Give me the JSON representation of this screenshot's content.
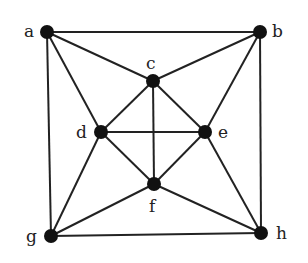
{
  "graph": {
    "nodes": [
      {
        "id": "a",
        "label": "a",
        "x": 47,
        "y": 32,
        "lx": 24,
        "ly": 37
      },
      {
        "id": "b",
        "label": "b",
        "x": 260,
        "y": 32,
        "lx": 272,
        "ly": 37
      },
      {
        "id": "c",
        "label": "c",
        "x": 153,
        "y": 81,
        "lx": 146,
        "ly": 69
      },
      {
        "id": "d",
        "label": "d",
        "x": 101,
        "y": 132,
        "lx": 76,
        "ly": 138
      },
      {
        "id": "e",
        "label": "e",
        "x": 205,
        "y": 132,
        "lx": 218,
        "ly": 138
      },
      {
        "id": "f",
        "label": "f",
        "x": 154,
        "y": 184,
        "lx": 149,
        "ly": 212
      },
      {
        "id": "g",
        "label": "g",
        "x": 51,
        "y": 236,
        "lx": 26,
        "ly": 242
      },
      {
        "id": "h",
        "label": "h",
        "x": 261,
        "y": 233,
        "lx": 276,
        "ly": 239
      }
    ],
    "edges": [
      [
        "a",
        "b"
      ],
      [
        "a",
        "g"
      ],
      [
        "a",
        "c"
      ],
      [
        "a",
        "d"
      ],
      [
        "b",
        "c"
      ],
      [
        "b",
        "e"
      ],
      [
        "b",
        "h"
      ],
      [
        "c",
        "d"
      ],
      [
        "c",
        "e"
      ],
      [
        "c",
        "f"
      ],
      [
        "d",
        "e"
      ],
      [
        "d",
        "f"
      ],
      [
        "d",
        "g"
      ],
      [
        "e",
        "f"
      ],
      [
        "e",
        "h"
      ],
      [
        "f",
        "g"
      ],
      [
        "f",
        "h"
      ],
      [
        "g",
        "h"
      ]
    ],
    "colors": {
      "stroke": "#222222",
      "node": "#111111",
      "background": "#ffffff"
    }
  }
}
